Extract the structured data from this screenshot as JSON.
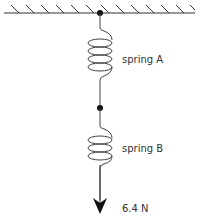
{
  "diagram": {
    "ceiling": {
      "label": "fixed support"
    },
    "springs": [
      {
        "id": "A",
        "label": "spring A"
      },
      {
        "id": "B",
        "label": "spring B"
      }
    ],
    "force": {
      "label": "6.4 N",
      "direction": "down"
    },
    "colors": {
      "line": "#333333",
      "dot": "#111111",
      "text": "#333333"
    }
  }
}
